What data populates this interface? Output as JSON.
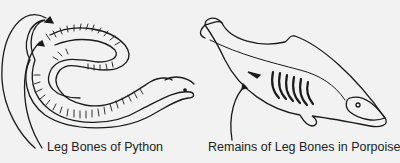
{
  "labels": {
    "python": "Leg Bones of Python",
    "porpoise": "Remains of Leg Bones in Porpoise"
  },
  "figures": [
    {
      "name": "python-skeleton",
      "annotation": "Leg Bones of Python"
    },
    {
      "name": "porpoise-skeleton",
      "annotation": "Remains of Leg Bones in Porpoise"
    }
  ],
  "colors": {
    "background": "#f2f2f2",
    "ink": "#1a1a1a"
  }
}
